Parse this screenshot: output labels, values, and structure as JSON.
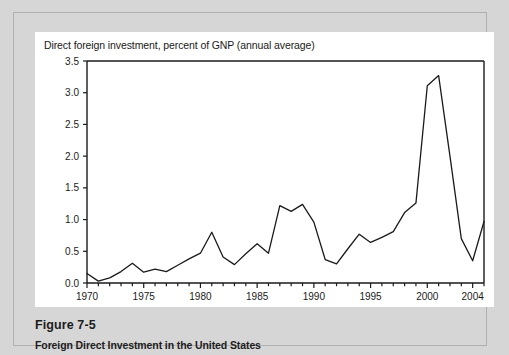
{
  "figure": {
    "number_label": "Figure 7-5",
    "caption": "Foreign Direct Investment in the United States"
  },
  "colors": {
    "page_background": "#d6d6d6",
    "panel_background": "#ffffff",
    "frame_border": "#b0b0b0",
    "axis": "#1a1a1a",
    "line": "#1a1a1a",
    "text": "#1a1a1a"
  },
  "chart_data": {
    "type": "line",
    "title": "Direct foreign investment, percent of GNP (annual average)",
    "xlabel": "",
    "ylabel": "",
    "xlim": [
      1970,
      2005
    ],
    "ylim": [
      0.0,
      3.5
    ],
    "grid": false,
    "legend": "none",
    "ytick_labels": [
      "0.0",
      "0.5",
      "1.0",
      "1.5",
      "2.0",
      "2.5",
      "3.0",
      "3.5"
    ],
    "ytick_values": [
      0.0,
      0.5,
      1.0,
      1.5,
      2.0,
      2.5,
      3.0,
      3.5
    ],
    "xtick_labels": [
      "1970",
      "1975",
      "1980",
      "1985",
      "1990",
      "1995",
      "2000",
      "2004"
    ],
    "xtick_values": [
      1970,
      1975,
      1980,
      1985,
      1990,
      1995,
      2000,
      2004
    ],
    "x_minor_ticks_every": 1,
    "x": [
      1970,
      1971,
      1972,
      1973,
      1974,
      1975,
      1976,
      1977,
      1978,
      1979,
      1980,
      1981,
      1982,
      1983,
      1984,
      1985,
      1986,
      1987,
      1988,
      1989,
      1990,
      1991,
      1992,
      1993,
      1994,
      1995,
      1996,
      1997,
      1998,
      1999,
      2000,
      2001,
      2002,
      2003,
      2004,
      2005
    ],
    "values": [
      0.15,
      0.03,
      0.08,
      0.18,
      0.31,
      0.17,
      0.22,
      0.18,
      0.28,
      0.38,
      0.47,
      0.8,
      0.41,
      0.29,
      0.46,
      0.62,
      0.47,
      1.22,
      1.13,
      1.24,
      0.96,
      0.37,
      0.3,
      0.54,
      0.77,
      0.64,
      0.72,
      0.81,
      1.11,
      1.26,
      3.11,
      3.27,
      2.0,
      0.7,
      0.35,
      0.97
    ],
    "series_name": "Direct foreign investment, percent of GNP"
  }
}
